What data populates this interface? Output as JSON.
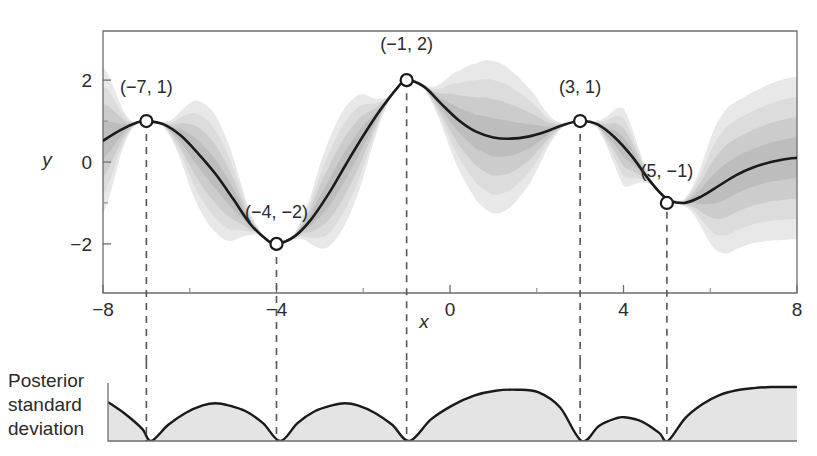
{
  "chart_data": {
    "type": "line",
    "title": "",
    "subtitle": "",
    "xlabel": "x",
    "ylabel": "y",
    "xlim": [
      -8,
      8
    ],
    "ylim": [
      -3.2,
      3.2
    ],
    "grid": false,
    "legend_position": "none",
    "x_ticks": [
      -8,
      -4,
      0,
      4,
      8
    ],
    "x_tick_labels": [
      "−8",
      "−4",
      "0",
      "4",
      "8"
    ],
    "x_minor_ticks": [
      -6,
      -2,
      2,
      6
    ],
    "y_ticks": [
      -2,
      0,
      2
    ],
    "y_tick_labels": [
      "−2",
      "0",
      "2"
    ],
    "y_minor_ticks": [
      -1,
      1
    ],
    "series": [
      {
        "name": "posterior mean",
        "type": "line",
        "color": "#1a1a1a",
        "x": [
          -8.0,
          -7.6,
          -7.2,
          -7.0,
          -6.6,
          -6.2,
          -5.8,
          -5.4,
          -5.0,
          -4.6,
          -4.2,
          -4.0,
          -3.6,
          -3.2,
          -2.8,
          -2.4,
          -2.0,
          -1.6,
          -1.2,
          -1.0,
          -0.6,
          -0.2,
          0.2,
          0.6,
          1.0,
          1.4,
          1.8,
          2.2,
          2.6,
          3.0,
          3.4,
          3.8,
          4.2,
          4.6,
          5.0,
          5.4,
          5.8,
          6.2,
          6.6,
          7.0,
          7.4,
          7.8,
          8.0
        ],
        "y": [
          0.52,
          0.78,
          0.97,
          1.0,
          0.92,
          0.64,
          0.2,
          -0.3,
          -0.9,
          -1.52,
          -1.92,
          -2.0,
          -1.83,
          -1.4,
          -0.78,
          -0.06,
          0.64,
          1.28,
          1.83,
          2.0,
          1.84,
          1.42,
          1.02,
          0.74,
          0.6,
          0.57,
          0.62,
          0.74,
          0.9,
          1.0,
          0.92,
          0.6,
          0.13,
          -0.45,
          -0.9,
          -1.0,
          -0.84,
          -0.58,
          -0.32,
          -0.13,
          0.0,
          0.08,
          0.1
        ]
      }
    ],
    "observations": {
      "name": "observed data points",
      "marker": "open-circle",
      "marker_facecolor": "#ffffff",
      "marker_edgecolor": "#1a1a1a",
      "points": [
        {
          "x": -7,
          "y": 1,
          "label": "(−7, 1)",
          "label_dx": 0,
          "label_dy": -28
        },
        {
          "x": -4,
          "y": -2,
          "label": "(−4, −2)",
          "label_dx": 0,
          "label_dy": -26
        },
        {
          "x": -1,
          "y": 2,
          "label": "(−1, 2)",
          "label_dx": 0,
          "label_dy": -30
        },
        {
          "x": 3,
          "y": 1,
          "label": "(3, 1)",
          "label_dx": 0,
          "label_dy": -28
        },
        {
          "x": 5,
          "y": -1,
          "label": "(5, −1)",
          "label_dx": 0,
          "label_dy": -26
        }
      ]
    },
    "uncertainty_bands": {
      "name": "posterior confidence bands",
      "description": "nested gray shaded envelopes around the posterior mean, widest between observations and pinching to zero at each observation",
      "levels": [
        {
          "sigma_multiple": 3.0,
          "color": "#e8e8e8"
        },
        {
          "sigma_multiple": 2.25,
          "color": "#dcdcdc"
        },
        {
          "sigma_multiple": 1.5,
          "color": "#cccccc"
        },
        {
          "sigma_multiple": 0.75,
          "color": "#bdbdbd"
        }
      ],
      "sigma_at_x": [
        {
          "x": -8.0,
          "sigma": 0.62
        },
        {
          "x": -7.0,
          "sigma": 0.0
        },
        {
          "x": -5.5,
          "sigma": 0.48
        },
        {
          "x": -4.0,
          "sigma": 0.0
        },
        {
          "x": -2.5,
          "sigma": 0.48
        },
        {
          "x": -1.0,
          "sigma": 0.0
        },
        {
          "x": 1.0,
          "sigma": 0.62
        },
        {
          "x": 3.0,
          "sigma": 0.0
        },
        {
          "x": 4.0,
          "sigma": 0.33
        },
        {
          "x": 5.0,
          "sigma": 0.0
        },
        {
          "x": 6.5,
          "sigma": 0.6
        },
        {
          "x": 8.0,
          "sigma": 0.66
        }
      ]
    },
    "dashed_droplines": {
      "name": "vertical dashed guide lines",
      "x_values": [
        -7,
        -4,
        -1,
        3,
        5
      ],
      "color": "#555555",
      "style": "dashed"
    }
  },
  "bottom_panel": {
    "label_lines": [
      "Posterior",
      "standard",
      "deviation"
    ],
    "type": "area",
    "fill_color": "#e4e4e4",
    "line_color": "#1a1a1a",
    "zeros_at_x": [
      -7,
      -4,
      -1,
      3,
      5
    ],
    "profile": {
      "x": [
        -8.0,
        -7.6,
        -7.2,
        -7.0,
        -6.6,
        -6.2,
        -5.8,
        -5.5,
        -5.2,
        -4.8,
        -4.4,
        -4.0,
        -3.6,
        -3.2,
        -2.8,
        -2.5,
        -2.2,
        -1.8,
        -1.4,
        -1.0,
        -0.5,
        0.0,
        0.5,
        1.0,
        1.5,
        2.0,
        2.5,
        3.0,
        3.4,
        3.8,
        4.0,
        4.4,
        4.8,
        5.0,
        5.4,
        5.8,
        6.2,
        6.6,
        7.0,
        7.4,
        7.8,
        8.0
      ],
      "y": [
        0.72,
        0.5,
        0.22,
        0.0,
        0.3,
        0.52,
        0.66,
        0.7,
        0.66,
        0.55,
        0.33,
        0.0,
        0.33,
        0.55,
        0.66,
        0.7,
        0.66,
        0.52,
        0.3,
        0.0,
        0.4,
        0.66,
        0.84,
        0.93,
        0.95,
        0.9,
        0.62,
        0.0,
        0.28,
        0.42,
        0.44,
        0.36,
        0.15,
        0.0,
        0.42,
        0.68,
        0.85,
        0.94,
        0.98,
        1.0,
        1.0,
        1.0
      ]
    }
  }
}
